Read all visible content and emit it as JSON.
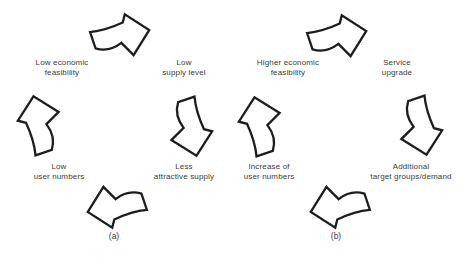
{
  "colors": {
    "background": "#ffffff",
    "arrow_outline": "#1d1d1d",
    "arrow_fill": "#ffffff",
    "text": "#3b3b3b"
  },
  "diagram": {
    "cycles": [
      {
        "caption": "(a)",
        "labels": {
          "top_left": {
            "line1": "Low economic",
            "line2": "feasibility"
          },
          "top_right": {
            "line1": "Low",
            "line2": "supply level"
          },
          "bottom_right": {
            "line1": "Less",
            "line2": "attractive supply"
          },
          "bottom_left": {
            "line1": "Low",
            "line2": "user numbers"
          }
        }
      },
      {
        "caption": "(b)",
        "labels": {
          "top_left": {
            "line1": "Higher economic",
            "line2": "feasibility"
          },
          "top_right": {
            "line1": "Service",
            "line2": "upgrade"
          },
          "bottom_right": {
            "line1": "Additional",
            "line2": "target groups/demand"
          },
          "bottom_left": {
            "line1": "Increase of",
            "line2": "user numbers"
          }
        }
      }
    ]
  }
}
